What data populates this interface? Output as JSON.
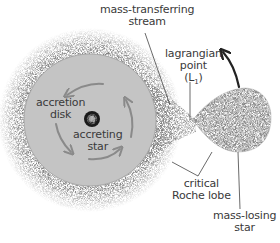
{
  "diagram": {
    "type": "binary-star accretion diagram",
    "labels": {
      "stream_line1": "mass-transferring",
      "stream_line2": "stream",
      "lagrangian_line1": "lagrangian",
      "lagrangian_line2": "point",
      "lagrangian_line3": "(L",
      "lagrangian_sub": "1",
      "lagrangian_close": ")",
      "disk_line1": "accretion",
      "disk_line2": "disk",
      "accreting_line1": "accreting",
      "accreting_line2": "star",
      "roche_line1": "critical",
      "roche_line2": "Roche lobe",
      "losing_line1": "mass-losing",
      "losing_line2": "star"
    },
    "colors": {
      "disk_fill": "#c4c4c4",
      "text": "#3a3a3a",
      "arrow": "#8a8a8a",
      "leader": "#444444",
      "orbit_arrow": "#222222",
      "star_dark": "#1a1a1a"
    }
  }
}
